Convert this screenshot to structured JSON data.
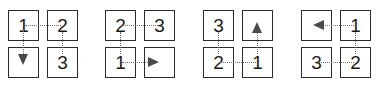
{
  "figure": {
    "colors": {
      "cell_border": "#2b2b2b",
      "connector": "#6e6e6e",
      "arrowhead": "#4a4a4a",
      "label": "#1a1a1a",
      "background": "#ffffff"
    }
  },
  "grids": [
    {
      "name": "grid-1",
      "cells": [
        {
          "position": "top-left",
          "label": "1"
        },
        {
          "position": "top-right",
          "label": "2"
        },
        {
          "position": "bottom-left",
          "label": ""
        },
        {
          "position": "bottom-right",
          "label": "3"
        }
      ],
      "connectors": [
        {
          "from": "top-left",
          "to": "top-right",
          "direction": "right",
          "arrowhead": false
        },
        {
          "from": "top-left",
          "to": "bottom-left",
          "direction": "down",
          "arrowhead": true
        },
        {
          "from": "top-right",
          "to": "bottom-right",
          "direction": "down",
          "arrowhead": false
        }
      ]
    },
    {
      "name": "grid-2",
      "cells": [
        {
          "position": "top-left",
          "label": "2"
        },
        {
          "position": "top-right",
          "label": "3"
        },
        {
          "position": "bottom-left",
          "label": "1"
        },
        {
          "position": "bottom-right",
          "label": ""
        }
      ],
      "connectors": [
        {
          "from": "top-left",
          "to": "top-right",
          "direction": "right",
          "arrowhead": false
        },
        {
          "from": "top-left",
          "to": "bottom-left",
          "direction": "down",
          "arrowhead": false
        },
        {
          "from": "bottom-left",
          "to": "bottom-right",
          "direction": "right",
          "arrowhead": true
        }
      ]
    },
    {
      "name": "grid-3",
      "cells": [
        {
          "position": "top-left",
          "label": "3"
        },
        {
          "position": "top-right",
          "label": ""
        },
        {
          "position": "bottom-left",
          "label": "2"
        },
        {
          "position": "bottom-right",
          "label": "1"
        }
      ],
      "connectors": [
        {
          "from": "top-left",
          "to": "bottom-left",
          "direction": "down",
          "arrowhead": false
        },
        {
          "from": "bottom-left",
          "to": "bottom-right",
          "direction": "right",
          "arrowhead": false
        },
        {
          "from": "bottom-right",
          "to": "top-right",
          "direction": "up",
          "arrowhead": true
        }
      ]
    },
    {
      "name": "grid-4",
      "cells": [
        {
          "position": "top-left",
          "label": ""
        },
        {
          "position": "top-right",
          "label": "1"
        },
        {
          "position": "bottom-left",
          "label": "3"
        },
        {
          "position": "bottom-right",
          "label": "2"
        }
      ],
      "connectors": [
        {
          "from": "top-right",
          "to": "top-left",
          "direction": "left",
          "arrowhead": true
        },
        {
          "from": "top-right",
          "to": "bottom-right",
          "direction": "down",
          "arrowhead": false
        },
        {
          "from": "bottom-right",
          "to": "bottom-left",
          "direction": "left",
          "arrowhead": false
        }
      ]
    }
  ]
}
